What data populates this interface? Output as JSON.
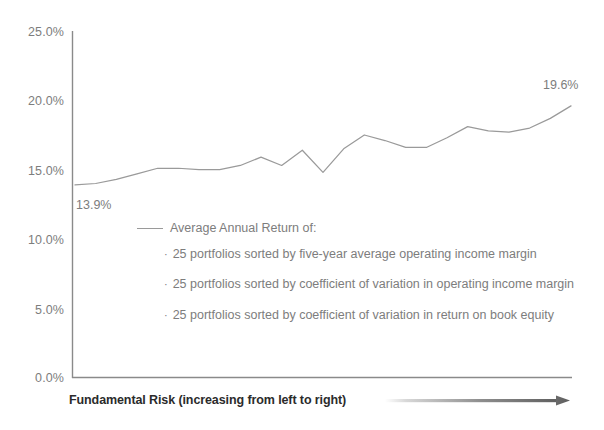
{
  "chart_data": {
    "type": "line",
    "title": "",
    "xlabel": "Fundamental Risk (increasing from left to right)",
    "ylabel": "",
    "ylim": [
      0.0,
      25.0
    ],
    "yticks": [
      25.0,
      20.0,
      15.0,
      10.0,
      5.0,
      0.0
    ],
    "ytick_labels": [
      "25.0%",
      "20.0%",
      "15.0%",
      "10.0%",
      "5.0%",
      "0.0%"
    ],
    "grid": false,
    "legend_position": "inside-center",
    "x": [
      1,
      2,
      3,
      4,
      5,
      6,
      7,
      8,
      9,
      10,
      11,
      12,
      13,
      14,
      15,
      16,
      17,
      18,
      19,
      20,
      21,
      22,
      23,
      24,
      25
    ],
    "series": [
      {
        "name": "Average Annual Return",
        "color": "#9a9a9a",
        "values": [
          13.9,
          14.0,
          14.3,
          14.7,
          15.1,
          15.1,
          15.0,
          15.0,
          15.3,
          15.9,
          15.3,
          16.4,
          14.8,
          16.5,
          17.5,
          17.1,
          16.6,
          16.6,
          17.3,
          18.1,
          17.8,
          17.7,
          18.0,
          18.7,
          19.6
        ]
      }
    ],
    "annotations": [
      {
        "text": "13.9%",
        "x_value": 1,
        "y_value": 13.9,
        "position": "below-left"
      },
      {
        "text": "19.6%",
        "x_value": 25,
        "y_value": 19.6,
        "position": "above-left"
      }
    ],
    "legend": {
      "header": "Average  Annual Return of:",
      "items": [
        "25 portfolios sorted by five-year average operating income margin",
        "25 portfolios sorted by coefficient of variation in operating income margin",
        "25 portfolios sorted by coefficient of variation in return on book equity"
      ],
      "bullet": "·"
    },
    "axis_color": "#8a8a8a",
    "arrow": {
      "name": "increasing-risk-arrow",
      "direction": "right",
      "gradient_from": "#ffffff",
      "gradient_to": "#5e5e5e"
    }
  }
}
